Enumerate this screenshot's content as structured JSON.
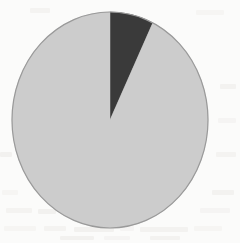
{
  "figure": {
    "kind": "scanned-pie-chart",
    "title": "",
    "caption": "",
    "background_color": "#fbfbfa"
  },
  "geometry": {
    "center_x": 110,
    "center_y": 120,
    "radius_x": 98,
    "radius_y": 108,
    "start_angle_deg": 0,
    "outline_color": "#9a9a9a",
    "outline_width": 1.2
  },
  "chart_data": {
    "type": "pie",
    "title": "",
    "xlabel": "",
    "ylabel": "",
    "grid": false,
    "legend_position": "none",
    "start_angle_deg": 0,
    "direction": "clockwise",
    "categories": [
      "Dark slice",
      "Light slice"
    ],
    "values": [
      7.2,
      92.8
    ],
    "labels": [
      "",
      ""
    ],
    "colors": [
      "#3a3a3a",
      "#cccccc"
    ],
    "slices": [
      {
        "name": "Dark slice",
        "value": 7.2,
        "percent": "7.2%",
        "angle_deg": 26,
        "start_deg": 0,
        "end_deg": 26,
        "color": "#3a3a3a",
        "label": ""
      },
      {
        "name": "Light slice",
        "value": 92.8,
        "percent": "92.8%",
        "angle_deg": 334,
        "start_deg": 26,
        "end_deg": 360,
        "color": "#cccccc",
        "label": ""
      }
    ]
  },
  "artifacts": {
    "description": "faint bleed-through text ghosting from scanned page",
    "marks": [
      {
        "x": 4,
        "y": 226,
        "w": 32,
        "h": 5
      },
      {
        "x": 44,
        "y": 226,
        "w": 22,
        "h": 5
      },
      {
        "x": 74,
        "y": 227,
        "w": 40,
        "h": 5
      },
      {
        "x": 120,
        "y": 226,
        "w": 14,
        "h": 5
      },
      {
        "x": 140,
        "y": 227,
        "w": 48,
        "h": 5
      },
      {
        "x": 194,
        "y": 226,
        "w": 28,
        "h": 5
      },
      {
        "x": 6,
        "y": 208,
        "w": 26,
        "h": 5
      },
      {
        "x": 38,
        "y": 209,
        "w": 18,
        "h": 5
      },
      {
        "x": 200,
        "y": 208,
        "w": 30,
        "h": 5
      },
      {
        "x": 212,
        "y": 190,
        "w": 22,
        "h": 5
      },
      {
        "x": 2,
        "y": 190,
        "w": 16,
        "h": 5
      },
      {
        "x": 216,
        "y": 152,
        "w": 20,
        "h": 5
      },
      {
        "x": 0,
        "y": 152,
        "w": 12,
        "h": 5
      },
      {
        "x": 218,
        "y": 118,
        "w": 18,
        "h": 5
      },
      {
        "x": 220,
        "y": 84,
        "w": 16,
        "h": 5
      },
      {
        "x": 196,
        "y": 10,
        "w": 28,
        "h": 5
      },
      {
        "x": 30,
        "y": 8,
        "w": 20,
        "h": 5
      },
      {
        "x": 60,
        "y": 236,
        "w": 34,
        "h": 4
      },
      {
        "x": 104,
        "y": 236,
        "w": 26,
        "h": 4
      },
      {
        "x": 150,
        "y": 236,
        "w": 30,
        "h": 4
      }
    ]
  }
}
